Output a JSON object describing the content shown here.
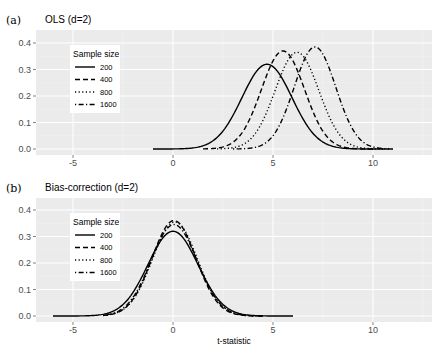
{
  "chart_data": [
    {
      "type": "line",
      "panel_label": "(a)",
      "title": "OLS (d=2)",
      "xlabel": "",
      "ylabel": "",
      "xlim": [
        -6.85,
        12.95
      ],
      "ylim": [
        -0.02,
        0.45
      ],
      "xticks": [
        -5,
        0,
        5,
        10
      ],
      "xtick_labels": [
        "-5",
        "0",
        "5",
        "10"
      ],
      "yticks": [
        0.0,
        0.1,
        0.2,
        0.3,
        0.4
      ],
      "ytick_labels": [
        "0.0",
        "0.1",
        "0.2",
        "0.3",
        "0.4"
      ],
      "grid": true,
      "legend": {
        "title": "Sample size",
        "position": "top-left-inside",
        "entries": [
          "200",
          "400",
          "800",
          "1600"
        ]
      },
      "series": [
        {
          "name": "200",
          "linetype": "solid",
          "x_range": [
            -1.0,
            11.0
          ],
          "mean": 4.7,
          "sd": 1.25,
          "peak": 0.32
        },
        {
          "name": "400",
          "linetype": "dashed",
          "x_range": [
            1.5,
            10.0
          ],
          "mean": 5.5,
          "sd": 1.08,
          "peak": 0.37
        },
        {
          "name": "800",
          "linetype": "dotted",
          "x_range": [
            2.2,
            10.5
          ],
          "mean": 6.2,
          "sd": 1.09,
          "peak": 0.365
        },
        {
          "name": "1600",
          "linetype": "dotdash",
          "x_range": [
            3.0,
            10.8
          ],
          "mean": 7.1,
          "sd": 1.04,
          "peak": 0.385
        }
      ]
    },
    {
      "type": "line",
      "panel_label": "(b)",
      "title": "Bias-correction (d=2)",
      "xlabel": "t-statistic",
      "ylabel": "",
      "xlim": [
        -6.85,
        12.95
      ],
      "ylim": [
        -0.02,
        0.45
      ],
      "xticks": [
        -5,
        0,
        5,
        10
      ],
      "xtick_labels": [
        "-5",
        "0",
        "5",
        "10"
      ],
      "yticks": [
        0.0,
        0.1,
        0.2,
        0.3,
        0.4
      ],
      "ytick_labels": [
        "0.0",
        "0.1",
        "0.2",
        "0.3",
        "0.4"
      ],
      "grid": true,
      "legend": {
        "title": "Sample size",
        "position": "top-left-inside",
        "entries": [
          "200",
          "400",
          "800",
          "1600"
        ]
      },
      "series": [
        {
          "name": "200",
          "linetype": "solid",
          "x_range": [
            -6.0,
            6.0
          ],
          "mean": 0.0,
          "sd": 1.25,
          "peak": 0.32
        },
        {
          "name": "400",
          "linetype": "dashed",
          "x_range": [
            -3.5,
            4.5
          ],
          "mean": 0.05,
          "sd": 1.1,
          "peak": 0.36
        },
        {
          "name": "800",
          "linetype": "dotted",
          "x_range": [
            -3.5,
            4.5
          ],
          "mean": 0.1,
          "sd": 1.12,
          "peak": 0.355
        },
        {
          "name": "1600",
          "linetype": "dotdash",
          "x_range": [
            -3.5,
            4.5
          ],
          "mean": 0.05,
          "sd": 1.15,
          "peak": 0.345
        }
      ]
    }
  ]
}
